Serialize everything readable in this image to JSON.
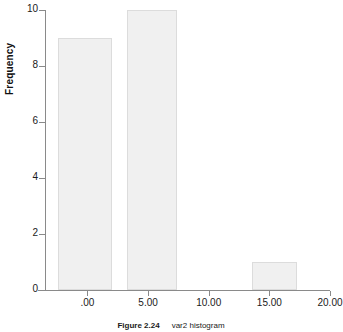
{
  "caption": {
    "figure_number": "Figure 2.24",
    "description": "var2 histogram"
  },
  "chart_data": {
    "type": "bar",
    "title": "",
    "subtitle": "",
    "xlabel": "",
    "ylabel": "Frequency",
    "grid": false,
    "legend": null,
    "xlim": [
      -3.5,
      20.0
    ],
    "ylim": [
      0,
      10
    ],
    "x_tick_labels": [
      ".00",
      "5.00",
      "10.00",
      "15.00",
      "20.00"
    ],
    "x_tick_values": [
      0,
      5,
      10,
      15,
      20
    ],
    "y_tick_labels": [
      "0",
      "2",
      "4",
      "6",
      "8",
      "10"
    ],
    "y_tick_values": [
      0,
      2,
      4,
      6,
      8,
      10
    ],
    "bar_fill_color": "#f0f0f0",
    "bar_border_color": "#dcdcdc",
    "axis_color": "#8a8a8a",
    "bars": [
      {
        "label": ".00",
        "bin_start": -2.4,
        "bin_end": 2.0,
        "center": 0.0,
        "value": 9
      },
      {
        "label": "5.00",
        "bin_start": 3.3,
        "bin_end": 7.4,
        "center": 5.0,
        "value": 10
      },
      {
        "label": "15.00",
        "bin_start": 13.6,
        "bin_end": 17.3,
        "center": 15.5,
        "value": 1
      }
    ],
    "categories": [
      ".00",
      "5.00",
      "15.00"
    ],
    "values": [
      9,
      10,
      1
    ]
  }
}
